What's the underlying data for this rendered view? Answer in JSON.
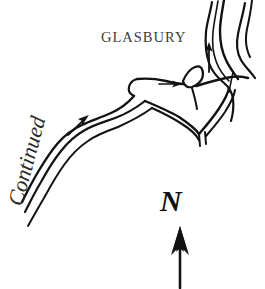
{
  "figure": {
    "kind": "hand-drawn sketch map",
    "background_color": "#ffffff",
    "ink_color": "#121212",
    "width": 265,
    "height": 289
  },
  "labels": {
    "place_name": "GLASBURY",
    "continuation_note": "Continued",
    "north_letter": "N"
  },
  "compass": {
    "letter": "N",
    "direction": "up",
    "arrow_name": "north-arrow"
  },
  "features": {
    "river_name": "river-channel",
    "road_name": "road-corridor",
    "junction_name": "road-junction-island",
    "bridge_name": "river-bridge"
  },
  "direction_arrows": [
    {
      "name": "road-direction-arrow-southwest",
      "points": "northeast"
    },
    {
      "name": "road-direction-arrow-east",
      "points": "east"
    },
    {
      "name": "river-flow-arrow",
      "points": "north"
    }
  ]
}
